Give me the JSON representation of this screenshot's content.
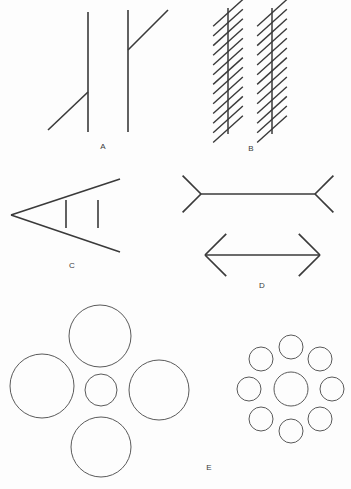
{
  "plate": {
    "background_color": "#fdfdfd",
    "stroke_color": "#3a3a3a",
    "circle_stroke_color": "#5a5a5a",
    "width": 351,
    "height": 489
  },
  "panels": [
    {
      "key": "A",
      "label": "A",
      "illusion_name": "Poggendorff illusion",
      "label_position": {
        "x": 103,
        "y": 148
      }
    },
    {
      "key": "B",
      "label": "B",
      "illusion_name": "Zollner illusion",
      "label_position": {
        "x": 251,
        "y": 150
      }
    },
    {
      "key": "C",
      "label": "C",
      "illusion_name": "Ponzo illusion",
      "label_position": {
        "x": 72,
        "y": 267
      }
    },
    {
      "key": "D",
      "label": "D",
      "illusion_name": "Muller-Lyer illusion",
      "label_position": {
        "x": 262,
        "y": 287
      }
    },
    {
      "key": "E",
      "label": "E",
      "illusion_name": "Ebbinghaus illusion",
      "label_position": {
        "x": 209,
        "y": 469
      }
    }
  ],
  "chart_data": {
    "type": "diagram",
    "title": "",
    "figure_A_poggendorff": {
      "vertical_lines": [
        {
          "x": 88,
          "y1": 12,
          "y2": 132
        },
        {
          "x": 128,
          "y1": 10,
          "y2": 132
        }
      ],
      "oblique_segments": [
        {
          "x1": 48,
          "y1": 130,
          "x2": 88,
          "y2": 92
        },
        {
          "x1": 128,
          "y1": 50,
          "x2": 168,
          "y2": 10
        }
      ]
    },
    "figure_B_zollner": {
      "vertical_lines": [
        {
          "x": 228,
          "y1": 8,
          "y2": 134
        },
        {
          "x": 272,
          "y1": 8,
          "y2": 134
        }
      ],
      "hatch_count_per_line": 13,
      "hatch_angle_deg": 42,
      "hatch_half_length": 20
    },
    "figure_C_ponzo": {
      "apex": {
        "x": 11,
        "y": 215
      },
      "upper_ray_end": {
        "x": 120,
        "y": 179
      },
      "lower_ray_end": {
        "x": 120,
        "y": 252
      },
      "test_bars": [
        {
          "x": 66,
          "y1": 200,
          "y2": 228
        },
        {
          "x": 98,
          "y1": 200,
          "y2": 228
        }
      ]
    },
    "figure_D_mullerlyer": {
      "outward_fins_figure": {
        "shaft": {
          "x1": 201,
          "y1": 194,
          "x2": 315,
          "y2": 194
        },
        "fin_length": 26,
        "fin_angle_deg": 45,
        "fin_direction": "outward"
      },
      "inward_fins_figure": {
        "shaft": {
          "x1": 205,
          "y1": 255,
          "x2": 320,
          "y2": 255
        },
        "fin_length": 30,
        "fin_angle_deg": 45,
        "fin_direction": "inward"
      }
    },
    "figure_E_ebbinghaus": {
      "left_group": {
        "center_circle": {
          "cx": 101,
          "cy": 390,
          "r": 16
        },
        "surrounding_circles": [
          {
            "cx": 100,
            "cy": 336,
            "r": 31
          },
          {
            "cx": 42,
            "cy": 386,
            "r": 32
          },
          {
            "cx": 159,
            "cy": 390,
            "r": 30
          },
          {
            "cx": 101,
            "cy": 447,
            "r": 30
          }
        ]
      },
      "right_group": {
        "center_circle": {
          "cx": 291,
          "cy": 389,
          "r": 17
        },
        "surrounding_circles": [
          {
            "cx": 291,
            "cy": 347,
            "r": 12
          },
          {
            "cx": 320,
            "cy": 359,
            "r": 12
          },
          {
            "cx": 332,
            "cy": 389,
            "r": 12
          },
          {
            "cx": 320,
            "cy": 419,
            "r": 12
          },
          {
            "cx": 291,
            "cy": 431,
            "r": 12
          },
          {
            "cx": 261,
            "cy": 419,
            "r": 12
          },
          {
            "cx": 249,
            "cy": 389,
            "r": 12
          },
          {
            "cx": 261,
            "cy": 359,
            "r": 12
          }
        ]
      }
    }
  }
}
